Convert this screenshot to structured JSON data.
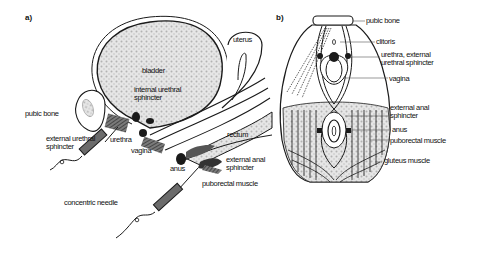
{
  "panel_a": {
    "tag": "a)",
    "labels": {
      "bladder": "bladder",
      "internal_urethral_sphincter_1": "internal urethral",
      "internal_urethral_sphincter_2": "sphincter",
      "uterus": "uterus",
      "pubic_bone": "pubic bone",
      "external_urethral_sphincter_1": "external urethral",
      "external_urethral_sphincter_2": "sphincter",
      "urethra": "urethra",
      "vagina": "vagina",
      "rectum": "rectum",
      "anus": "anus",
      "external_anal_sphincter_1": "external anal",
      "external_anal_sphincter_2": "sphincter",
      "puborectal_muscle": "puborectal muscle",
      "concentric_needle": "concentric needle"
    }
  },
  "panel_b": {
    "tag": "b)",
    "labels": {
      "pubic_bone": "pubic bone",
      "clitoris": "clitoris",
      "urethra_1": "urethra, external",
      "urethra_2": "urethral sphincter",
      "vagina": "vagina",
      "external_anal_sphincter_1": "external anal",
      "external_anal_sphincter_2": "sphincter",
      "anus": "anus",
      "puborectal_muscle": "puborectal muscle",
      "gluteus_muscle": "gluteus muscle"
    }
  },
  "colors": {
    "ink": "#1a1a1a",
    "stipple": "#bdbdbd",
    "muscle": "#4a4a4a",
    "needle": "#6b6b6b"
  }
}
